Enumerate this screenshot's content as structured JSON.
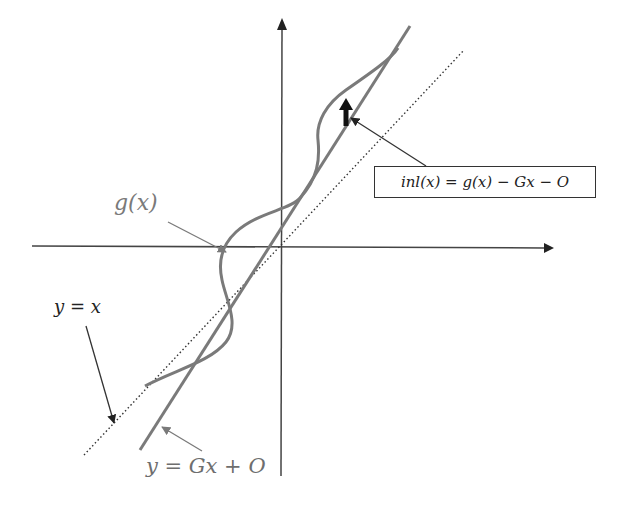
{
  "diagram": {
    "type": "transfer-function-nonlinearity",
    "labels": {
      "g_curve": "g(x)",
      "ideal_line": "y = x",
      "fit_line": "y = Gx + O",
      "inl_formula": "inl(x) = g(x) − Gx − O"
    },
    "axes": {
      "x_axis": "horizontal with arrow to right",
      "y_axis": "vertical with arrow upward"
    },
    "colors": {
      "axes": "#333333",
      "g_curve": "#7a7a7a",
      "fit_line": "#7a7a7a",
      "ideal_line": "#333333",
      "inl_arrow": "#111111"
    }
  }
}
